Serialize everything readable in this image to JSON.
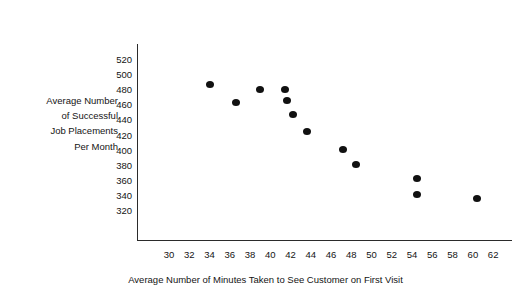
{
  "chart_data": {
    "type": "scatter",
    "title": "",
    "xlabel": "Average Number of Minutes Taken to See Customer on First Visit",
    "ylabel": "Average Number of Successful Job Placements Per Month",
    "ylabel_lines": [
      "Average Number",
      "of Successful",
      "Job Placements",
      "Per Month"
    ],
    "xlim": [
      29,
      63
    ],
    "ylim": [
      310,
      528
    ],
    "xticks": [
      30,
      32,
      34,
      36,
      38,
      40,
      42,
      44,
      46,
      48,
      50,
      52,
      54,
      56,
      58,
      60,
      62
    ],
    "yticks": [
      520,
      500,
      480,
      460,
      440,
      420,
      400,
      380,
      360,
      340,
      320
    ],
    "xtick_labels": [
      "30",
      "32",
      "34",
      "36",
      "38",
      "40",
      "42",
      "44",
      "46",
      "48",
      "50",
      "52",
      "54",
      "56",
      "58",
      "60",
      "62"
    ],
    "ytick_labels": [
      "520",
      "500",
      "480",
      "460",
      "440",
      "420",
      "400",
      "380",
      "360",
      "340",
      "320"
    ],
    "grid": false,
    "legend": false,
    "marker_color": "#111111",
    "axis_color": "#2b2b2b",
    "background_color": "#ffffff",
    "points": [
      {
        "x": 34.0,
        "y": 487
      },
      {
        "x": 36.6,
        "y": 464
      },
      {
        "x": 39.0,
        "y": 481
      },
      {
        "x": 41.5,
        "y": 481
      },
      {
        "x": 41.6,
        "y": 467
      },
      {
        "x": 42.2,
        "y": 448
      },
      {
        "x": 43.6,
        "y": 425
      },
      {
        "x": 47.2,
        "y": 402
      },
      {
        "x": 48.5,
        "y": 381
      },
      {
        "x": 54.5,
        "y": 363
      },
      {
        "x": 54.5,
        "y": 342
      },
      {
        "x": 60.4,
        "y": 337
      }
    ]
  }
}
